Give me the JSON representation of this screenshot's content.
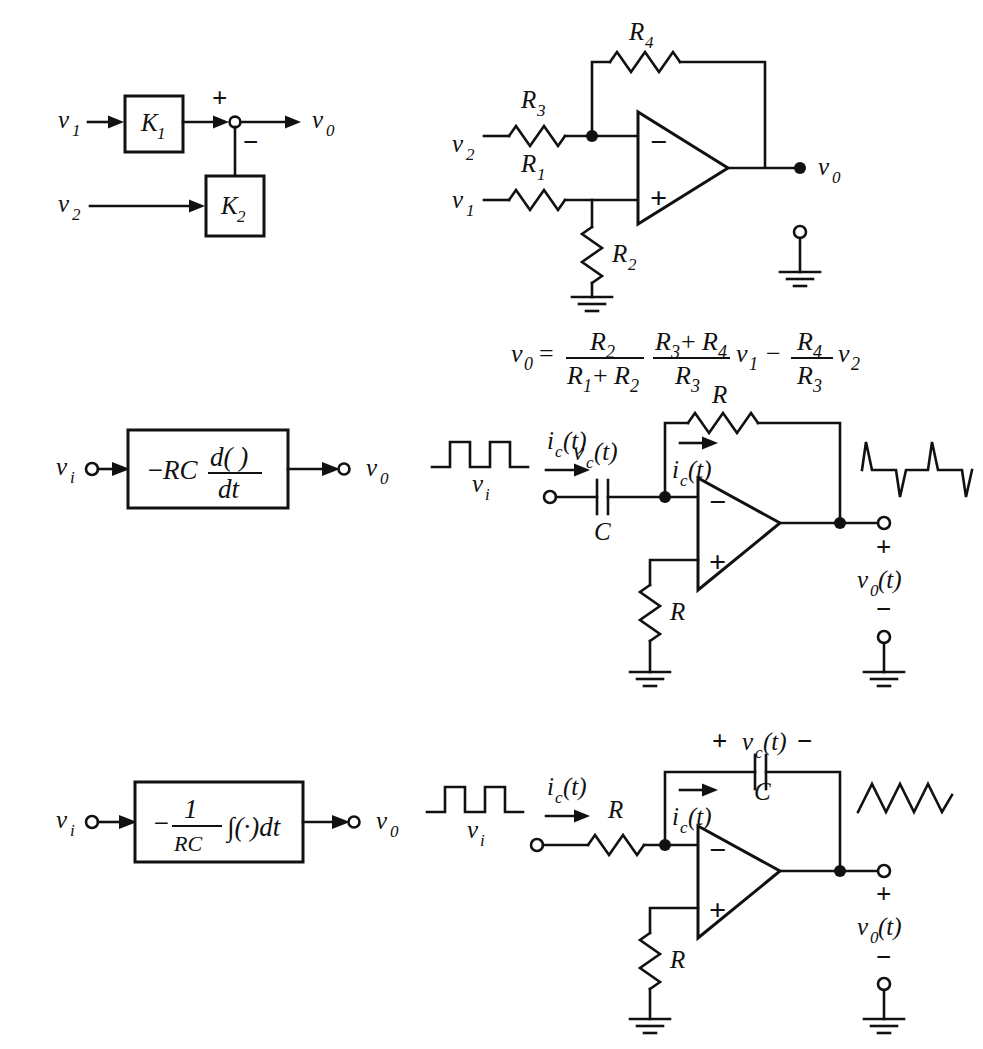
{
  "figure": {
    "background_color": "#ffffff",
    "line_color": "#111111"
  },
  "rows": [
    {
      "id": "difference-amplifier",
      "block_diagram": {
        "name": "difference-amplifier-block-diagram",
        "inputs": [
          {
            "label": "v",
            "sub": "1"
          },
          {
            "label": "v",
            "sub": "2"
          }
        ],
        "blocks": [
          {
            "label": "K",
            "sub": "1"
          },
          {
            "label": "K",
            "sub": "2"
          }
        ],
        "summing_junction": {
          "plus": "+",
          "minus": "−"
        },
        "output": {
          "label": "v",
          "sub": "0"
        }
      },
      "circuit": {
        "name": "difference-amplifier-circuit",
        "type": "op-amp difference amplifier",
        "inputs": [
          {
            "label": "v",
            "sub": "2"
          },
          {
            "label": "v",
            "sub": "1"
          }
        ],
        "resistors": [
          {
            "label": "R",
            "sub": "4",
            "position": "feedback"
          },
          {
            "label": "R",
            "sub": "3",
            "position": "inverting-input"
          },
          {
            "label": "R",
            "sub": "1",
            "position": "noninverting-input"
          },
          {
            "label": "R",
            "sub": "2",
            "position": "noninverting-to-ground"
          }
        ],
        "opamp": {
          "minus": "−",
          "plus": "+"
        },
        "output": {
          "label": "v",
          "sub": "0"
        },
        "ground_symbols": 2
      },
      "equation": {
        "name": "difference-amplifier-equation",
        "lhs": {
          "label": "v",
          "sub": "0"
        },
        "equals": "=",
        "term1": {
          "numerator": {
            "label": "R",
            "sub": "2"
          },
          "denominator": {
            "label": "R",
            "sub": "1",
            "op": "+",
            "label2": "R",
            "sub2": "2"
          }
        },
        "term2": {
          "numerator": {
            "label": "R",
            "sub": "3",
            "op": "+",
            "label2": "R",
            "sub2": "4"
          },
          "denominator": {
            "label": "R",
            "sub": "3"
          }
        },
        "var1": {
          "label": "v",
          "sub": "1"
        },
        "minus": "−",
        "term3": {
          "numerator": {
            "label": "R",
            "sub": "4"
          },
          "denominator": {
            "label": "R",
            "sub": "3"
          }
        },
        "var2": {
          "label": "v",
          "sub": "2"
        },
        "plain_text": "v0 = R2/(R1+R2) (R3+R4)/R3 v1 - R4/R3 v2"
      }
    },
    {
      "id": "differentiator",
      "block_diagram": {
        "name": "differentiator-block-diagram",
        "input": {
          "label": "v",
          "sub": "i"
        },
        "output": {
          "label": "v",
          "sub": "0"
        },
        "expression": {
          "sign": "−",
          "coefficient": "RC",
          "numerator": "d( )",
          "denominator": "dt",
          "plain_text": "-RC d( )/dt"
        }
      },
      "circuit": {
        "name": "differentiator-circuit",
        "type": "op-amp differentiator",
        "input_waveform": {
          "name": "square-wave-input",
          "shape": "square",
          "label": "v",
          "sub": "i"
        },
        "output_waveform": {
          "name": "spike-wave-output",
          "shape": "impulse-spikes"
        },
        "currents": [
          {
            "label": "i",
            "sub": "c",
            "arg": "(t)",
            "position": "input"
          },
          {
            "label": "i",
            "sub": "c",
            "arg": "(t)",
            "position": "feedback"
          }
        ],
        "capacitor": {
          "voltage": {
            "label": "v",
            "sub": "c",
            "arg": "(t)"
          },
          "label": "C",
          "position": "input-series"
        },
        "resistors": [
          {
            "label": "R",
            "position": "feedback"
          },
          {
            "label": "R",
            "position": "noninverting-to-ground"
          }
        ],
        "opamp": {
          "minus": "−",
          "plus": "+"
        },
        "output": {
          "plus": "+",
          "label": "v",
          "sub": "0",
          "arg": "(t)",
          "minus": "−"
        },
        "ground_symbols": 2
      }
    },
    {
      "id": "integrator",
      "block_diagram": {
        "name": "integrator-block-diagram",
        "input": {
          "label": "v",
          "sub": "i"
        },
        "output": {
          "label": "v",
          "sub": "0"
        },
        "expression": {
          "sign": "−",
          "numerator": "1",
          "denominator": "RC",
          "integral": "∫(·)dt",
          "plain_text": "-(1/RC) ∫(·)dt"
        }
      },
      "circuit": {
        "name": "integrator-circuit",
        "type": "op-amp integrator",
        "input_waveform": {
          "name": "square-wave-input",
          "shape": "square",
          "label": "v",
          "sub": "i"
        },
        "output_waveform": {
          "name": "triangle-wave-output",
          "shape": "triangle"
        },
        "currents": [
          {
            "label": "i",
            "sub": "c",
            "arg": "(t)",
            "position": "input"
          },
          {
            "label": "i",
            "sub": "c",
            "arg": "(t)",
            "position": "feedback"
          }
        ],
        "capacitor": {
          "voltage": {
            "plus": "+",
            "label": "v",
            "sub": "c",
            "arg": "(t)",
            "minus": "−"
          },
          "label": "C",
          "position": "feedback"
        },
        "resistors": [
          {
            "label": "R",
            "position": "input-series"
          },
          {
            "label": "R",
            "position": "noninverting-to-ground"
          }
        ],
        "opamp": {
          "minus": "−",
          "plus": "+"
        },
        "output": {
          "plus": "+",
          "label": "v",
          "sub": "0",
          "arg": "(t)",
          "minus": "−"
        },
        "ground_symbols": 2
      }
    }
  ],
  "glyphs": {
    "v": "v",
    "K": "K",
    "R": "R",
    "C": "C",
    "i": "i",
    "t_arg": "(t)",
    "plus": "+",
    "minus": "−",
    "equals": "=",
    "dt": "dt",
    "d_paren": "d( )",
    "integral_dt": "∫(·)dt",
    "RC": "RC",
    "one": "1"
  }
}
